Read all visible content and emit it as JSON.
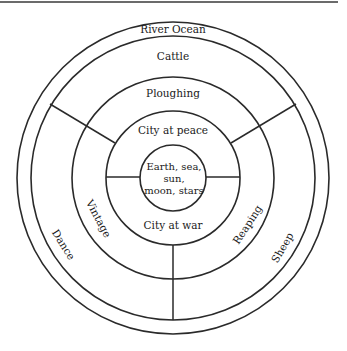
{
  "diagram": {
    "labels": {
      "outer_ring": "River Ocean",
      "ring_top": "Cattle",
      "ring_left": "Dance",
      "ring_right": "Sheep",
      "middle_top": "Ploughing",
      "middle_left": "Vintage",
      "middle_right": "Reaping",
      "inner_top": "City at peace",
      "inner_bottom": "City at war",
      "center_line1": "Earth, sea,",
      "center_line2": "sun,",
      "center_line3": "moon, stars"
    },
    "colors": {
      "line": "#2a2a2a",
      "text": "#1a1a1a",
      "background": "#ffffff"
    }
  }
}
